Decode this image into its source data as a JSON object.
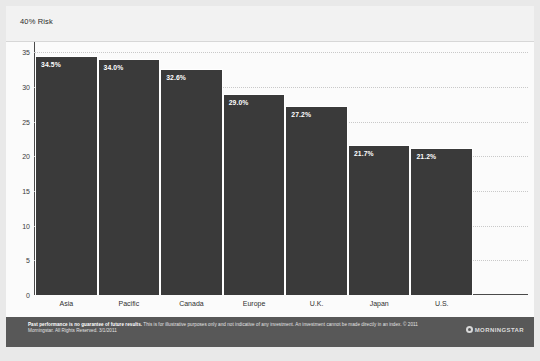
{
  "header": {
    "label": "40% Risk"
  },
  "chart_data": {
    "type": "bar",
    "title": "40% Risk",
    "xlabel": "",
    "ylabel": "",
    "ylim": [
      0,
      36.5
    ],
    "yticks": [
      0,
      5,
      10,
      15,
      20,
      25,
      30,
      35
    ],
    "grid": true,
    "legend": "none",
    "categories": [
      "Asia",
      "Pacific",
      "Canada",
      "Europe",
      "U.K.",
      "Japan",
      "U.S."
    ],
    "values": [
      34.5,
      34.0,
      32.6,
      29.0,
      27.2,
      21.7,
      21.2
    ],
    "data_labels": [
      "34.5%",
      "34.0%",
      "32.6%",
      "29.0%",
      "27.2%",
      "21.7%",
      "21.2%"
    ],
    "bar_color": "#3a3a3a",
    "label_color": "#ffffff"
  },
  "footer": {
    "line1_bold": "Past performance is no guarantee of future results.",
    "line1_rest": " This is for illustrative purposes only and not indicative of any investment. An investment cannot",
    "line2": "be made directly in an index. © 2011 Morningstar. All Rights Reserved. 3/1/2011",
    "logo_text": "MORNINGSTAR"
  }
}
